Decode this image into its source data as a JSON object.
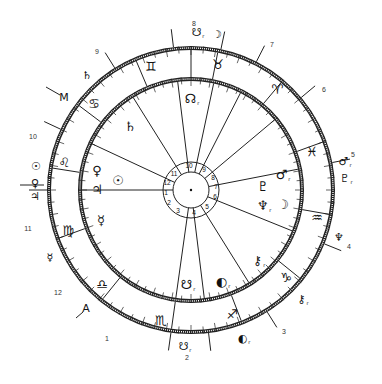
{
  "title": "",
  "chart_geometry": {
    "center": [
      191,
      190
    ],
    "outer_ring_radius": 142,
    "inner_ring_radius": 111,
    "hub_outer_radius": 28,
    "hub_inner_radius": 18
  },
  "outer_house_numbers": [
    {
      "label": "1",
      "x": 107,
      "y": 338
    },
    {
      "label": "2",
      "x": 187,
      "y": 357
    },
    {
      "label": "3",
      "x": 284,
      "y": 331
    },
    {
      "label": "4",
      "x": 349,
      "y": 246
    },
    {
      "label": "5",
      "x": 353,
      "y": 154
    },
    {
      "label": "6",
      "x": 324,
      "y": 89
    },
    {
      "label": "7",
      "x": 272,
      "y": 44
    },
    {
      "label": "8",
      "x": 194,
      "y": 23
    },
    {
      "label": "9",
      "x": 97,
      "y": 51
    },
    {
      "label": "10",
      "x": 33,
      "y": 136
    },
    {
      "label": "11",
      "x": 28,
      "y": 228
    },
    {
      "label": "12",
      "x": 58,
      "y": 292
    }
  ],
  "hub_numbers": [
    {
      "label": "10",
      "x": 189,
      "y": 166
    },
    {
      "label": "9",
      "x": 204,
      "y": 170
    },
    {
      "label": "8",
      "x": 213,
      "y": 178
    },
    {
      "label": "7",
      "x": 216,
      "y": 187
    },
    {
      "label": "6",
      "x": 215,
      "y": 197
    },
    {
      "label": "5",
      "x": 207,
      "y": 207
    },
    {
      "label": "4",
      "x": 194,
      "y": 213
    },
    {
      "label": "3",
      "x": 178,
      "y": 211
    },
    {
      "label": "2",
      "x": 169,
      "y": 203
    },
    {
      "label": "1",
      "x": 166,
      "y": 193
    },
    {
      "label": "12",
      "x": 167,
      "y": 183
    },
    {
      "label": "11",
      "x": 174,
      "y": 174
    }
  ],
  "zodiac_signs": [
    {
      "name": "gemini",
      "glyph": "♊",
      "x": 151,
      "y": 66
    },
    {
      "name": "taurus",
      "glyph": "♉",
      "x": 218,
      "y": 64
    },
    {
      "name": "aries",
      "glyph": "♈",
      "x": 277,
      "y": 89
    },
    {
      "name": "pisces",
      "glyph": "♓",
      "x": 312,
      "y": 151
    },
    {
      "name": "aquarius",
      "glyph": "♒",
      "x": 317,
      "y": 217
    },
    {
      "name": "capricorn",
      "glyph": "♑",
      "x": 286,
      "y": 277
    },
    {
      "name": "sagittarius",
      "glyph": "♐",
      "x": 232,
      "y": 314
    },
    {
      "name": "scorpio",
      "glyph": "♏",
      "x": 161,
      "y": 320
    },
    {
      "name": "libra",
      "glyph": "♎",
      "x": 102,
      "y": 284
    },
    {
      "name": "virgo",
      "glyph": "♍",
      "x": 68,
      "y": 230
    },
    {
      "name": "leo",
      "glyph": "♌",
      "x": 64,
      "y": 162
    },
    {
      "name": "cancer",
      "glyph": "♋",
      "x": 94,
      "y": 103
    }
  ],
  "inner_planets": [
    {
      "name": "north-node",
      "glyph": "☊",
      "sub": "r",
      "x": 192,
      "y": 99
    },
    {
      "name": "saturn",
      "glyph": "♄",
      "sub": "",
      "x": 130,
      "y": 126
    },
    {
      "name": "venus",
      "glyph": "♀",
      "sub": "",
      "x": 97,
      "y": 170
    },
    {
      "name": "sun",
      "glyph": "☉",
      "sub": "",
      "x": 118,
      "y": 180
    },
    {
      "name": "jupiter",
      "glyph": "♃",
      "sub": "",
      "x": 97,
      "y": 189
    },
    {
      "name": "mercury",
      "glyph": "☿",
      "sub": "",
      "x": 101,
      "y": 220
    },
    {
      "name": "mars",
      "glyph": "♂",
      "sub": "r",
      "x": 283,
      "y": 175
    },
    {
      "name": "pluto",
      "glyph": "♇",
      "sub": "",
      "x": 263,
      "y": 186
    },
    {
      "name": "neptune",
      "glyph": "♆",
      "sub": "r",
      "x": 264,
      "y": 206
    },
    {
      "name": "moon",
      "glyph": "☽",
      "sub": "",
      "x": 283,
      "y": 204
    },
    {
      "name": "chiron",
      "glyph": "⚷",
      "sub": "r",
      "x": 259,
      "y": 261
    },
    {
      "name": "lilith",
      "glyph": "◐",
      "sub": "r",
      "x": 223,
      "y": 282
    },
    {
      "name": "south-node",
      "glyph": "☋",
      "sub": "r",
      "x": 188,
      "y": 285
    }
  ],
  "outer_planets": [
    {
      "name": "south-node-outer",
      "glyph": "☋",
      "sub": "r",
      "x": 198,
      "y": 33
    },
    {
      "name": "moon-outer",
      "glyph": "☽",
      "sub": "",
      "x": 217,
      "y": 34
    },
    {
      "name": "saturn-outer",
      "glyph": "♄",
      "sub": "",
      "x": 87,
      "y": 75
    },
    {
      "name": "midheaven",
      "glyph": "M",
      "sub": "",
      "x": 64,
      "y": 97
    },
    {
      "name": "sun-outer",
      "glyph": "☉",
      "sub": "",
      "x": 36,
      "y": 166
    },
    {
      "name": "venus-outer",
      "glyph": "♀",
      "sub": "",
      "x": 35,
      "y": 183
    },
    {
      "name": "jupiter-outer",
      "glyph": "♃",
      "sub": "",
      "x": 35,
      "y": 196
    },
    {
      "name": "mercury-outer",
      "glyph": "☿",
      "sub": "",
      "x": 50,
      "y": 257
    },
    {
      "name": "ascendant",
      "glyph": "A",
      "sub": "",
      "x": 86,
      "y": 308
    },
    {
      "name": "south-node-outer-2",
      "glyph": "☋",
      "sub": "r",
      "x": 185,
      "y": 347
    },
    {
      "name": "lilith-outer",
      "glyph": "◐",
      "sub": "r",
      "x": 244,
      "y": 339
    },
    {
      "name": "chiron-outer",
      "glyph": "⚷",
      "sub": "r",
      "x": 303,
      "y": 300
    },
    {
      "name": "neptune-outer",
      "glyph": "♆",
      "sub": "",
      "x": 339,
      "y": 237
    },
    {
      "name": "mars-outer",
      "glyph": "♂",
      "sub": "r",
      "x": 345,
      "y": 162
    },
    {
      "name": "pluto-outer",
      "glyph": "♇",
      "sub": "r",
      "x": 346,
      "y": 179
    }
  ],
  "house_cusps_deg": [
    180,
    155,
    122,
    97,
    78,
    63,
    40,
    11,
    338,
    302,
    277,
    262
  ],
  "sign_boundaries_deg": [
    90,
    79,
    50,
    20,
    350,
    321,
    291,
    262,
    231,
    200,
    171,
    143,
    113
  ],
  "axis_lines": [
    {
      "name": "mc-line",
      "x1": 46,
      "y1": 87,
      "x2": 60,
      "y2": 95
    },
    {
      "name": "asc-line",
      "x1": 76,
      "y1": 318,
      "x2": 83,
      "y2": 312
    },
    {
      "name": "left-arrow",
      "x1": 20,
      "y1": 185,
      "x2": 44,
      "y2": 185
    }
  ]
}
